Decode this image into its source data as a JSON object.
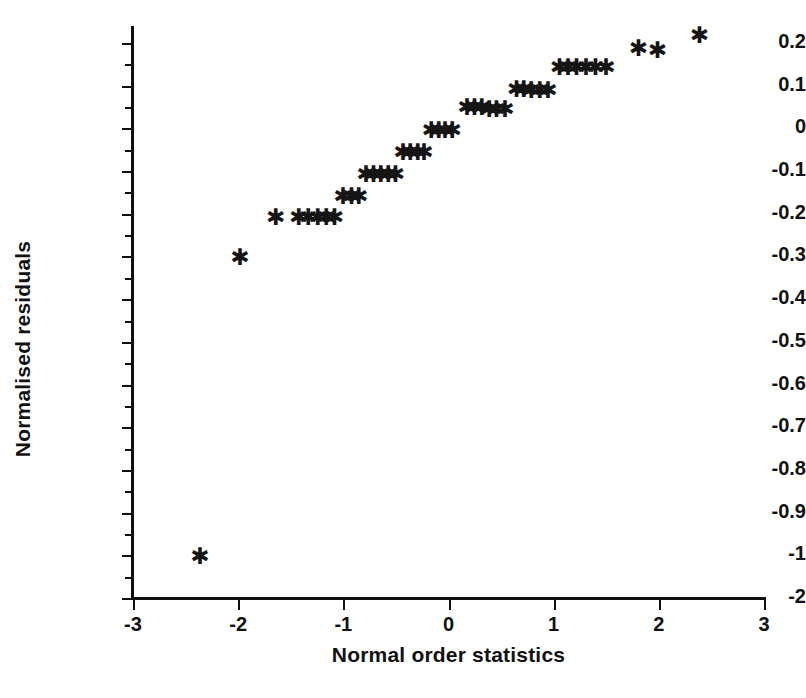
{
  "chart_data": {
    "type": "scatter",
    "title": "",
    "xlabel": "Normal order statistics",
    "ylabel": "Normalised residuals",
    "xlim": [
      -3,
      3
    ],
    "ylim": [
      -1.1,
      0.25
    ],
    "grid": false,
    "legend": null,
    "marker": "asterisk",
    "marker_color": "#151515",
    "xticks": [
      -3,
      -2,
      -1,
      0,
      1,
      2,
      3
    ],
    "xtick_labels": [
      "-3",
      "-2",
      "-1",
      "0",
      "1",
      "2",
      "3"
    ],
    "yticks": [
      0.2,
      0.1,
      0,
      -0.1,
      -0.2,
      -0.3,
      -0.4,
      -0.5,
      -0.6,
      -0.7,
      -0.8,
      -0.9,
      -1,
      -1.1
    ],
    "ytick_labels": [
      "0.2",
      "0.1",
      "0",
      "-0.1",
      "-0.2",
      "-0.3",
      "-0.4",
      "-0.5",
      "-0.6",
      "-0.7",
      "-0.8",
      "-0.9",
      "-1",
      "-2"
    ],
    "yminor_ticks": [
      0.15,
      0.05,
      -0.05,
      -0.15,
      -0.25,
      -0.35,
      -0.45,
      -0.55,
      -0.65,
      -0.75,
      -0.85,
      -0.95,
      -1.05
    ],
    "points": [
      {
        "x": -2.38,
        "y": -1.0
      },
      {
        "x": -2.0,
        "y": -0.3
      },
      {
        "x": -1.66,
        "y": -0.205
      },
      {
        "x": -1.44,
        "y": -0.205
      },
      {
        "x": -1.35,
        "y": -0.205
      },
      {
        "x": -1.26,
        "y": -0.205
      },
      {
        "x": -1.18,
        "y": -0.205
      },
      {
        "x": -1.1,
        "y": -0.205
      },
      {
        "x": -1.02,
        "y": -0.155
      },
      {
        "x": -0.94,
        "y": -0.155
      },
      {
        "x": -0.87,
        "y": -0.155
      },
      {
        "x": -0.8,
        "y": -0.105
      },
      {
        "x": -0.73,
        "y": -0.105
      },
      {
        "x": -0.66,
        "y": -0.105
      },
      {
        "x": -0.59,
        "y": -0.105
      },
      {
        "x": -0.52,
        "y": -0.105
      },
      {
        "x": -0.45,
        "y": -0.052
      },
      {
        "x": -0.38,
        "y": -0.052
      },
      {
        "x": -0.31,
        "y": -0.052
      },
      {
        "x": -0.25,
        "y": -0.052
      },
      {
        "x": -0.18,
        "y": -0.002
      },
      {
        "x": -0.11,
        "y": -0.002
      },
      {
        "x": -0.05,
        "y": -0.002
      },
      {
        "x": 0.02,
        "y": -0.002
      },
      {
        "x": 0.16,
        "y": 0.052
      },
      {
        "x": 0.23,
        "y": 0.052
      },
      {
        "x": 0.3,
        "y": 0.052
      },
      {
        "x": 0.37,
        "y": 0.048
      },
      {
        "x": 0.44,
        "y": 0.048
      },
      {
        "x": 0.52,
        "y": 0.048
      },
      {
        "x": 0.63,
        "y": 0.095
      },
      {
        "x": 0.7,
        "y": 0.095
      },
      {
        "x": 0.77,
        "y": 0.092
      },
      {
        "x": 0.85,
        "y": 0.092
      },
      {
        "x": 0.93,
        "y": 0.092
      },
      {
        "x": 1.04,
        "y": 0.145
      },
      {
        "x": 1.12,
        "y": 0.145
      },
      {
        "x": 1.2,
        "y": 0.145
      },
      {
        "x": 1.29,
        "y": 0.145
      },
      {
        "x": 1.38,
        "y": 0.145
      },
      {
        "x": 1.48,
        "y": 0.145
      },
      {
        "x": 1.79,
        "y": 0.19
      },
      {
        "x": 1.97,
        "y": 0.186
      },
      {
        "x": 2.37,
        "y": 0.222
      }
    ],
    "n_points": 44
  },
  "axes": {
    "x_title": "Normal order statistics",
    "y_title": "Normalised residuals"
  }
}
